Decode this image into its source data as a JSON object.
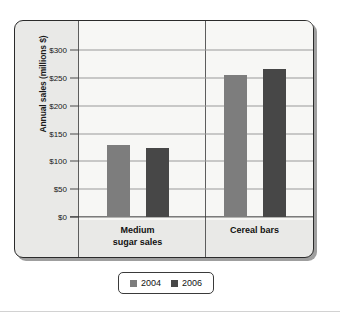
{
  "chart_data": {
    "type": "bar",
    "title": "",
    "xlabel": "",
    "ylabel": "Annual sales (millions $)",
    "categories": [
      "Medium sugar sales",
      "Cereal bars"
    ],
    "category_lines": [
      [
        "Medium",
        "sugar sales"
      ],
      [
        "Cereal bars"
      ]
    ],
    "series": [
      {
        "name": "2004",
        "color": "#7d7d7d",
        "values": [
          129,
          255
        ]
      },
      {
        "name": "2006",
        "color": "#474747",
        "values": [
          124,
          266
        ]
      }
    ],
    "ylim": [
      0,
      300
    ],
    "ytick_values": [
      300,
      250,
      200,
      150,
      100,
      50,
      0
    ],
    "ytick_labels": [
      "$300",
      "$250",
      "$200",
      "$150",
      "$100",
      "$50",
      "$0"
    ],
    "grid": true,
    "legend_position": "bottom",
    "legend_entries": [
      {
        "label": "2004",
        "color": "#7d7d7d"
      },
      {
        "label": "2006",
        "color": "#474747"
      }
    ]
  },
  "colors": {
    "series_2004": "#7d7d7d",
    "series_2006": "#474747",
    "frame_border": "#2b2b2b",
    "gutter_bg": "#e9e9e7",
    "plot_bg": "#f7f7f5",
    "gridline": "#9a9a9a",
    "axis": "#3a3a3a"
  }
}
